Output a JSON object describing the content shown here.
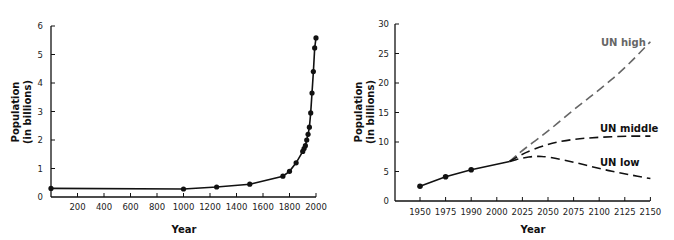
{
  "chart_data": [
    {
      "type": "line",
      "title": "",
      "xlabel": "Year",
      "ylabel": "Population\n(in billions)",
      "ylabel_lines": [
        "Population",
        "(in billions)"
      ],
      "xlim": [
        0,
        2000
      ],
      "ylim": [
        0,
        6
      ],
      "xticks": [
        200,
        400,
        600,
        800,
        1000,
        1200,
        1400,
        1600,
        1800,
        2000
      ],
      "yticks": [
        0,
        1,
        2,
        3,
        4,
        5,
        6
      ],
      "grid": false,
      "series": [
        {
          "name": "World population",
          "color": "#111111",
          "style": "solid-with-markers",
          "x": [
            0,
            1000,
            1250,
            1500,
            1750,
            1800,
            1850,
            1900,
            1910,
            1920,
            1930,
            1940,
            1950,
            1960,
            1970,
            1980,
            1990,
            2000
          ],
          "values": [
            0.3,
            0.28,
            0.35,
            0.45,
            0.73,
            0.9,
            1.2,
            1.6,
            1.7,
            1.8,
            2.0,
            2.2,
            2.45,
            2.95,
            3.65,
            4.4,
            5.23,
            5.58
          ]
        }
      ]
    },
    {
      "type": "line",
      "title": "",
      "xlabel": "Year",
      "ylabel": "Population\n(in billions)",
      "ylabel_lines": [
        "Population",
        "(in billions)"
      ],
      "categories": [
        "1950",
        "1975",
        "1990",
        "2000",
        "2025",
        "2050",
        "2075",
        "2100",
        "2125",
        "2150"
      ],
      "ylim": [
        0,
        30
      ],
      "yticks": [
        0,
        5,
        10,
        15,
        20,
        25,
        30
      ],
      "grid": false,
      "series": [
        {
          "name": "Historical",
          "color": "#111111",
          "style": "solid-with-markers",
          "x_index": [
            0,
            1,
            2,
            3.5
          ],
          "values": [
            2.5,
            4.1,
            5.3,
            6.7
          ],
          "marker_count": 3
        },
        {
          "name": "UN high",
          "color": "#666666",
          "style": "dashed",
          "x_index": [
            3.5,
            4,
            5,
            6,
            7,
            8,
            9
          ],
          "values": [
            6.7,
            8.6,
            11.8,
            15.5,
            18.8,
            22.5,
            27
          ]
        },
        {
          "name": "UN middle",
          "color": "#111111",
          "style": "dashed",
          "x_index": [
            3.5,
            4,
            5,
            6,
            7,
            8,
            9
          ],
          "values": [
            6.7,
            8.0,
            9.7,
            10.5,
            10.8,
            11.0,
            11.0
          ]
        },
        {
          "name": "UN low",
          "color": "#111111",
          "style": "dashed",
          "x_index": [
            3.5,
            4,
            4.5,
            5,
            6,
            7,
            8,
            9
          ],
          "values": [
            6.7,
            7.3,
            7.6,
            7.5,
            6.6,
            5.5,
            4.6,
            3.8
          ]
        }
      ],
      "annotations": [
        {
          "text": "UN high",
          "color": "#666666"
        },
        {
          "text": "UN middle",
          "color": "#111111"
        },
        {
          "text": "UN low",
          "color": "#111111"
        }
      ]
    }
  ]
}
